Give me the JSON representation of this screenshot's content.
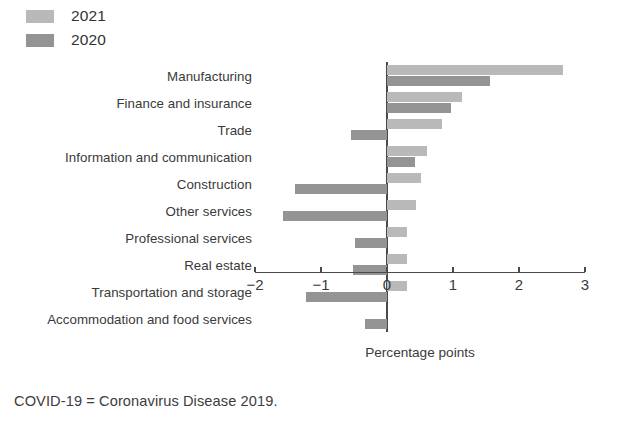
{
  "legend": {
    "entries": [
      {
        "label": "2021",
        "color": "#b9b9b9",
        "series": "2021"
      },
      {
        "label": "2020",
        "color": "#949494",
        "series": "2020"
      }
    ]
  },
  "axis": {
    "title": "Percentage points",
    "ticks": [
      "−2",
      "−1",
      "0",
      "1",
      "2",
      "3"
    ]
  },
  "footnote": {
    "text": "COVID-19 = Coronavirus Disease 2019."
  },
  "chart_data": {
    "type": "bar",
    "orientation": "horizontal",
    "title": "",
    "xlabel": "Percentage points",
    "ylabel": "",
    "xlim": [
      -2,
      3
    ],
    "xticks": [
      -2,
      -1,
      0,
      1,
      2,
      3
    ],
    "grid": false,
    "legend_position": "top-left",
    "categories": [
      "Manufacturing",
      "Finance and insurance",
      "Trade",
      "Information and communication",
      "Construction",
      "Other services",
      "Professional services",
      "Real estate",
      "Transportation and storage",
      "Accommodation and food services"
    ],
    "series": [
      {
        "name": "2021",
        "color": "#b9b9b9",
        "values": [
          2.66,
          1.14,
          0.83,
          0.6,
          0.52,
          0.44,
          0.31,
          0.31,
          0.31,
          0.0
        ]
      },
      {
        "name": "2020",
        "color": "#949494",
        "values": [
          1.56,
          0.97,
          -0.55,
          0.42,
          -1.4,
          -1.58,
          -0.48,
          -0.52,
          -1.23,
          -0.34
        ]
      }
    ]
  }
}
